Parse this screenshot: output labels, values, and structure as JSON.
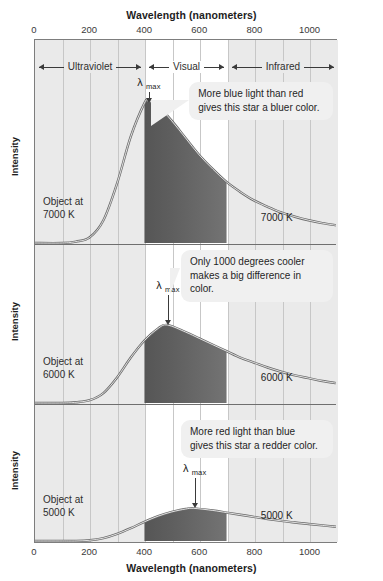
{
  "axis": {
    "x_title_top": "Wavelength (nanometers)",
    "x_title_bottom": "Wavelength (nanometers)",
    "y_title": "Intensity",
    "x_ticks": [
      "0",
      "200",
      "400",
      "600",
      "800",
      "1000"
    ],
    "x_tick_values": [
      0,
      200,
      400,
      600,
      800,
      1000
    ],
    "x_min": 0,
    "x_max": 1100,
    "gridline_step": 100
  },
  "bands": [
    {
      "name": "Ultraviolet",
      "label": "Ultraviolet",
      "start": 0,
      "end": 400,
      "shaded": true
    },
    {
      "name": "Visual",
      "label": "Visual",
      "start": 400,
      "end": 700,
      "shaded": false
    },
    {
      "name": "Infrared",
      "label": "Infrared",
      "start": 700,
      "end": 1100,
      "shaded": true
    }
  ],
  "panels": [
    {
      "object_label": "Object at\n7000 K",
      "curve_label": "7000 K",
      "lambda_max_label": "λ",
      "lambda_max_sub": "max",
      "lambda_max_nm": 414,
      "callout": "More blue light than red\ngives this star a bluer color."
    },
    {
      "object_label": "Object at\n6000 K",
      "curve_label": "6000 K",
      "lambda_max_label": "λ",
      "lambda_max_sub": "max",
      "lambda_max_nm": 483,
      "callout": "Only 1000 degrees cooler\nmakes a big difference in color."
    },
    {
      "object_label": "Object at\n5000 K",
      "curve_label": "5000 K",
      "lambda_max_label": "λ",
      "lambda_max_sub": "max",
      "lambda_max_nm": 580,
      "callout": "More red light than blue\ngives this star a redder color."
    }
  ],
  "chart_data": {
    "type": "line",
    "xlabel": "Wavelength (nanometers)",
    "ylabel": "Intensity",
    "xlim": [
      0,
      1100
    ],
    "grid": true,
    "legend": "inline curve labels",
    "shaded_regions": [
      {
        "label": "Ultraviolet",
        "range": [
          0,
          400
        ]
      },
      {
        "label": "Visual",
        "range": [
          400,
          700
        ]
      },
      {
        "label": "Infrared",
        "range": [
          700,
          1100
        ]
      }
    ],
    "series": [
      {
        "name": "7000 K",
        "panel": 1,
        "peak_wavelength_nm": 414,
        "peak_intensity": 1.0,
        "x": [
          0,
          100,
          150,
          200,
          250,
          300,
          350,
          400,
          414,
          450,
          500,
          550,
          600,
          650,
          700,
          750,
          800,
          850,
          900,
          950,
          1000,
          1050,
          1100
        ],
        "values": [
          0.0,
          0.0,
          0.01,
          0.04,
          0.16,
          0.42,
          0.75,
          0.985,
          1.0,
          0.965,
          0.86,
          0.74,
          0.62,
          0.52,
          0.43,
          0.36,
          0.3,
          0.255,
          0.215,
          0.185,
          0.16,
          0.14,
          0.125
        ]
      },
      {
        "name": "6000 K",
        "panel": 2,
        "peak_wavelength_nm": 483,
        "peak_intensity": 0.55,
        "x": [
          0,
          100,
          150,
          200,
          250,
          300,
          350,
          400,
          450,
          483,
          550,
          600,
          650,
          700,
          750,
          800,
          850,
          900,
          950,
          1000,
          1050,
          1100
        ],
        "values": [
          0.0,
          0.0,
          0.005,
          0.02,
          0.07,
          0.18,
          0.32,
          0.44,
          0.525,
          0.55,
          0.5,
          0.455,
          0.41,
          0.365,
          0.32,
          0.285,
          0.25,
          0.22,
          0.195,
          0.175,
          0.155,
          0.14
        ]
      },
      {
        "name": "5000 K",
        "panel": 3,
        "peak_wavelength_nm": 580,
        "peak_intensity": 0.23,
        "x": [
          0,
          100,
          150,
          200,
          250,
          300,
          350,
          400,
          450,
          500,
          550,
          580,
          650,
          700,
          750,
          800,
          850,
          900,
          950,
          1000,
          1050,
          1100
        ],
        "values": [
          0.0,
          0.0,
          0.0,
          0.005,
          0.02,
          0.05,
          0.09,
          0.135,
          0.175,
          0.205,
          0.225,
          0.23,
          0.215,
          0.2,
          0.185,
          0.17,
          0.155,
          0.142,
          0.13,
          0.12,
          0.11,
          0.1
        ]
      }
    ]
  },
  "colors": {
    "shaded_band": "#eaeaea",
    "gridline": "#c7c7c7",
    "axis": "#7d7d7d",
    "curve": "#5a5a5a",
    "callout_bg": "#f0f0f0",
    "visible_dark": "#3a3a3a",
    "visible_light": "#9a9a9a"
  }
}
